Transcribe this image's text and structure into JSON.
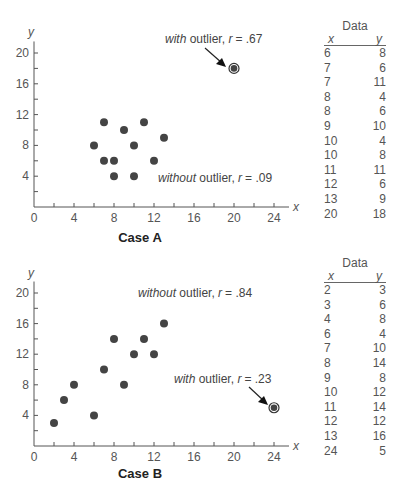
{
  "chart_data": [
    {
      "type": "scatter",
      "title": "Case A",
      "xlabel": "x",
      "ylabel": "y",
      "xlim": [
        0,
        25
      ],
      "ylim": [
        0,
        21
      ],
      "xticks": [
        0,
        4,
        8,
        12,
        16,
        20,
        24
      ],
      "yticks": [
        4,
        8,
        12,
        16,
        20
      ],
      "grid": false,
      "points": [
        [
          6,
          8
        ],
        [
          7,
          6
        ],
        [
          7,
          11
        ],
        [
          8,
          4
        ],
        [
          8,
          6
        ],
        [
          9,
          10
        ],
        [
          10,
          4
        ],
        [
          10,
          8
        ],
        [
          11,
          11
        ],
        [
          12,
          6
        ],
        [
          13,
          9
        ],
        [
          20,
          18
        ]
      ],
      "outlier": [
        20,
        18
      ],
      "annotations": [
        {
          "text_italic": "with",
          "text": " outlier, ",
          "r_label": "r",
          "value": "= .67"
        },
        {
          "text_italic": "without",
          "text": " outlier, ",
          "r_label": "r",
          "value": "= .09"
        }
      ],
      "table": {
        "title": "Data",
        "columns": [
          "x",
          "y"
        ],
        "rows": [
          [
            "6",
            "8"
          ],
          [
            "7",
            "6"
          ],
          [
            "7",
            "11"
          ],
          [
            "8",
            "4"
          ],
          [
            "8",
            "6"
          ],
          [
            "9",
            "10"
          ],
          [
            "10",
            "4"
          ],
          [
            "10",
            "8"
          ],
          [
            "11",
            "11"
          ],
          [
            "12",
            "6"
          ],
          [
            "13",
            "9"
          ],
          [
            "20",
            "18"
          ]
        ]
      }
    },
    {
      "type": "scatter",
      "title": "Case B",
      "xlabel": "x",
      "ylabel": "y",
      "xlim": [
        0,
        25
      ],
      "ylim": [
        0,
        21
      ],
      "xticks": [
        0,
        4,
        8,
        12,
        16,
        20,
        24
      ],
      "yticks": [
        4,
        8,
        12,
        16,
        20
      ],
      "grid": false,
      "points": [
        [
          2,
          3
        ],
        [
          3,
          6
        ],
        [
          4,
          8
        ],
        [
          6,
          4
        ],
        [
          7,
          10
        ],
        [
          8,
          14
        ],
        [
          9,
          8
        ],
        [
          10,
          12
        ],
        [
          11,
          14
        ],
        [
          12,
          12
        ],
        [
          13,
          16
        ],
        [
          24,
          5
        ]
      ],
      "outlier": [
        24,
        5
      ],
      "annotations": [
        {
          "text_italic": "without",
          "text": " outlier, ",
          "r_label": "r",
          "value": "= .84"
        },
        {
          "text_italic": "with",
          "text": " outlier, ",
          "r_label": "r",
          "value": "= .23"
        }
      ],
      "table": {
        "title": "Data",
        "columns": [
          "x",
          "y"
        ],
        "rows": [
          [
            "2",
            "3"
          ],
          [
            "3",
            "6"
          ],
          [
            "4",
            "8"
          ],
          [
            "6",
            "4"
          ],
          [
            "7",
            "10"
          ],
          [
            "8",
            "14"
          ],
          [
            "9",
            "8"
          ],
          [
            "10",
            "12"
          ],
          [
            "11",
            "14"
          ],
          [
            "12",
            "12"
          ],
          [
            "13",
            "16"
          ],
          [
            "24",
            "5"
          ]
        ]
      }
    }
  ]
}
